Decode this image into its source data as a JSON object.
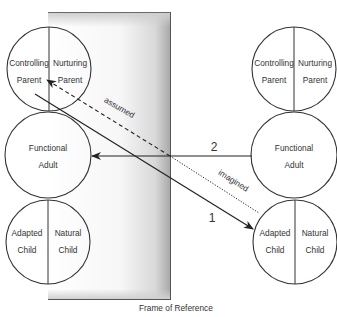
{
  "diagram": {
    "frame_label": "Frame of Reference",
    "left_person": {
      "parent": {
        "left": [
          "Controlling",
          "Parent"
        ],
        "right": [
          "Nurturing",
          "Parent"
        ]
      },
      "adult": [
        "Functional",
        "Adult"
      ],
      "child": {
        "left": [
          "Adapted",
          "Child"
        ],
        "right": [
          "Natural",
          "Child"
        ]
      }
    },
    "right_person": {
      "parent": {
        "left": [
          "Controlling",
          "Parent"
        ],
        "right": [
          "Nurturing",
          "Parent"
        ]
      },
      "adult": [
        "Functional",
        "Adult"
      ],
      "child": {
        "left": [
          "Adapted",
          "Child"
        ],
        "right": [
          "Natural",
          "Child"
        ]
      }
    },
    "transactions": [
      {
        "number": "1",
        "from": "Controlling Parent (left)",
        "to": "Adapted Child (right)",
        "style": "solid"
      },
      {
        "number": "2",
        "from": "Functional Adult (right)",
        "to": "Functional Adult (left)",
        "style": "solid"
      }
    ],
    "line_labels": {
      "assumed": "assumed",
      "imagined": "imagined"
    },
    "colors": {
      "line": "#333333",
      "frame_shadow": "#a9a9a9",
      "background": "#ffffff"
    }
  }
}
